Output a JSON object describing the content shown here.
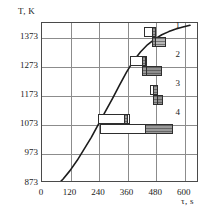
{
  "chart_data": {
    "type": "bar",
    "title": "",
    "subtitle": "",
    "xlabel": "τ, s",
    "ylabel": "T, K",
    "xlim": [
      0,
      660
    ],
    "ylim": [
      873,
      1423
    ],
    "xticks": [
      0,
      120,
      240,
      360,
      480,
      600
    ],
    "yticks": [
      873,
      973,
      1073,
      1173,
      1273,
      1373
    ],
    "xtick_labels": [
      "0",
      "120",
      "240",
      "360",
      "480",
      "600"
    ],
    "ytick_labels": [
      "873",
      "973",
      "1073",
      "1173",
      "1273",
      "1373"
    ],
    "grid": true,
    "legend": "none",
    "annotations": [
      "1",
      "2",
      "3",
      "4"
    ],
    "series": [
      {
        "name": "heating-curve",
        "type": "line",
        "x": [
          60,
          90,
          120,
          150,
          180,
          210,
          240,
          270,
          300,
          330,
          360,
          390,
          420,
          450,
          480,
          510,
          540,
          570,
          600,
          630
        ],
        "y": [
          855,
          880,
          910,
          945,
          985,
          1025,
          1070,
          1115,
          1160,
          1207,
          1252,
          1292,
          1323,
          1348,
          1367,
          1382,
          1393,
          1402,
          1409,
          1415
        ]
      }
    ],
    "bar_groups": [
      {
        "label": "1",
        "temperature": 1373,
        "bars": [
          {
            "name": "upper-open-bar",
            "style": "open",
            "x_start": 428,
            "x_end": 480,
            "block_start": 462,
            "block_end": 480,
            "row": "upper"
          },
          {
            "name": "lower-shaded-bar",
            "style": "light",
            "x_start": 462,
            "x_end": 523,
            "block_start": 462,
            "block_end": 480,
            "row": "lower"
          }
        ]
      },
      {
        "label": "2",
        "temperature": 1273,
        "bars": [
          {
            "name": "upper-open-bar",
            "style": "open",
            "x_start": 368,
            "x_end": 440,
            "block_start": 420,
            "block_end": 440,
            "row": "upper"
          },
          {
            "name": "lower-shaded-bar",
            "style": "dark",
            "x_start": 420,
            "x_end": 503,
            "block_start": 420,
            "block_end": 440,
            "row": "lower"
          }
        ]
      },
      {
        "label": "3",
        "temperature": 1173,
        "bars": [
          {
            "name": "upper-open-bar",
            "style": "open",
            "x_start": 452,
            "x_end": 487,
            "block_start": 466,
            "block_end": 487,
            "row": "upper"
          },
          {
            "name": "lower-shaded-bar",
            "style": "dark",
            "x_start": 466,
            "x_end": 508,
            "block_start": 466,
            "block_end": 487,
            "row": "lower"
          }
        ]
      },
      {
        "label": "4",
        "temperature": 1073,
        "bars": [
          {
            "name": "upper-open-bar",
            "style": "open",
            "x_start": 237,
            "x_end": 368,
            "block_start": 345,
            "block_end": 362,
            "row": "upper"
          },
          {
            "name": "lower-shaded-bar",
            "style": "open",
            "x_start": 243,
            "x_end": 553,
            "block_start": 432,
            "block_end": 553,
            "row": "lower"
          }
        ]
      }
    ]
  }
}
